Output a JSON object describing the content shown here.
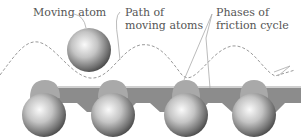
{
  "labels": {
    "moving_atom": "Moving atom",
    "path_line1": "Path of",
    "path_line2": "moving atoms",
    "phases_line1": "Phases of",
    "phases_line2": "friction cycle"
  },
  "colors": {
    "atom_dark": "#555555",
    "atom_light": "#f2f2f2",
    "band": "#8a8a8a",
    "phase_cap": "#a8a8a8",
    "path": "#999999",
    "text": "#555555"
  },
  "atoms": {
    "moving": {
      "cx": 89,
      "cy": 50,
      "r": 22
    },
    "substrate": [
      {
        "cx": 44,
        "cy": 115,
        "r": 22
      },
      {
        "cx": 113,
        "cy": 115,
        "r": 22
      },
      {
        "cx": 186,
        "cy": 115,
        "r": 22
      },
      {
        "cx": 254,
        "cy": 115,
        "r": 22
      }
    ]
  }
}
